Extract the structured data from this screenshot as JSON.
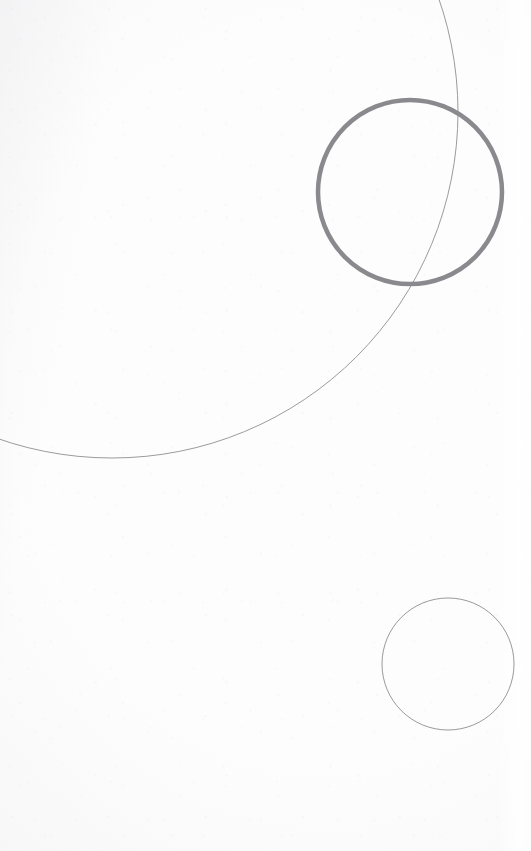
{
  "artwork": {
    "title": "Three Circles",
    "medium": "pen on paper",
    "canvas": {
      "width": 531,
      "height": 851
    },
    "background": {
      "name": "paper-background",
      "color": "#fdfdfd",
      "texture": "speckled off-white paper",
      "edge_highlight_color": "#ffffff"
    },
    "shapes": [
      {
        "id": "large-arc",
        "name": "large-thin-arc",
        "type": "arc",
        "description": "Large faint circular arc entering at the top edge and exiting at the left edge",
        "center_x": 112,
        "center_y": 112,
        "radius": 346,
        "stroke_color": "#9b9b9f",
        "stroke_width": 1,
        "enters_edge": "top",
        "enters_at_x": 302,
        "exits_edge": "left",
        "exits_at_y": 440,
        "lowest_point_y": 458
      },
      {
        "id": "bold-circle",
        "name": "bold-grey-circle",
        "type": "circle",
        "description": "Heavier-stroked grey circle in the upper right quadrant",
        "center_x": 410,
        "center_y": 192,
        "radius": 92,
        "stroke_color": "#8a8a8e",
        "stroke_width": 4.5,
        "bounds": {
          "left": 318,
          "top": 97,
          "right": 502,
          "bottom": 287
        }
      },
      {
        "id": "small-circle",
        "name": "small-thin-circle",
        "type": "circle",
        "description": "Small faint circle in the lower right quadrant, clipped by the right edge",
        "center_x": 448,
        "center_y": 664,
        "radius": 66,
        "stroke_color": "#9a9a9e",
        "stroke_width": 1,
        "bounds": {
          "left": 382,
          "top": 592,
          "right": 513,
          "bottom": 735
        }
      }
    ],
    "palette": {
      "paper": "#fdfdfd",
      "thin_line": "#9b9b9f",
      "bold_line": "#8a8a8e",
      "shadow_tint": "#d6d6da"
    }
  }
}
